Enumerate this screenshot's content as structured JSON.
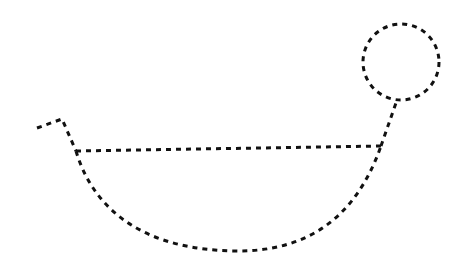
{
  "figure": {
    "background": "#ffffff",
    "stroke_color": "#111111",
    "stroke_style": "dashed",
    "shapes": {
      "tail": {
        "points": [
          [
            37,
            128
          ],
          [
            62,
            119
          ],
          [
            76,
            151
          ]
        ]
      },
      "rim_line": {
        "from": [
          76,
          151
        ],
        "to": [
          381,
          146
        ]
      },
      "bowl_arc": {
        "from": [
          76,
          151
        ],
        "bottom": [
          235,
          251
        ],
        "to": [
          381,
          146
        ]
      },
      "neck": {
        "from": [
          381,
          146
        ],
        "to": [
          397,
          100
        ]
      },
      "head_circle": {
        "cx": 401,
        "cy": 62,
        "r": 38
      }
    }
  }
}
